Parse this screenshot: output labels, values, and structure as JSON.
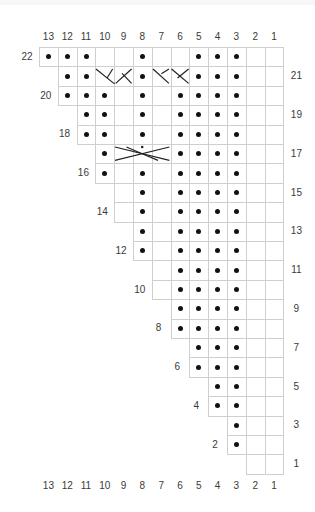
{
  "chart": {
    "title": "",
    "type": "knitting-chart",
    "columns": [
      13,
      12,
      11,
      10,
      9,
      8,
      7,
      6,
      5,
      4,
      3,
      2,
      1
    ],
    "legend": {
      "dot": "purl",
      "blank": "knit",
      "cable_2": "2-stitch cable cross",
      "cable_3": "3-stitch cable cross"
    },
    "colors": {
      "grid": "#cfcfcf",
      "symbol": "#111111",
      "text": "#3a3a3a"
    },
    "rows": [
      {
        "row": 22,
        "label_side": "left",
        "start_col": 13,
        "dots": [
          13,
          12,
          11,
          8,
          5,
          4,
          3
        ],
        "cables": []
      },
      {
        "row": 21,
        "label_side": "right",
        "start_col": 12,
        "dots": [
          12,
          11,
          8,
          5,
          4,
          3
        ],
        "cables": [
          {
            "from": 10,
            "to": 9,
            "dir": "left"
          },
          {
            "from": 7,
            "to": 6,
            "dir": "right"
          }
        ]
      },
      {
        "row": 20,
        "label_side": "left",
        "start_col": 12,
        "dots": [
          12,
          11,
          10,
          8,
          6,
          5,
          4,
          3
        ],
        "cables": []
      },
      {
        "row": 19,
        "label_side": "right",
        "start_col": 11,
        "dots": [
          11,
          10,
          8,
          6,
          5,
          4,
          3
        ],
        "cables": []
      },
      {
        "row": 18,
        "label_side": "left",
        "start_col": 11,
        "dots": [
          11,
          10,
          8,
          6,
          5,
          4,
          3
        ],
        "cables": []
      },
      {
        "row": 17,
        "label_side": "right",
        "start_col": 10,
        "dots": [
          10,
          6,
          5,
          4,
          3
        ],
        "cables": [
          {
            "from": 9,
            "to": 7,
            "dir": "cross3"
          }
        ]
      },
      {
        "row": 16,
        "label_side": "left",
        "start_col": 10,
        "dots": [
          10,
          8,
          6,
          5,
          4,
          3
        ],
        "cables": []
      },
      {
        "row": 15,
        "label_side": "right",
        "start_col": 9,
        "dots": [
          8,
          6,
          5,
          4,
          3
        ],
        "cables": []
      },
      {
        "row": 14,
        "label_side": "left",
        "start_col": 9,
        "dots": [
          8,
          6,
          5,
          4,
          3
        ],
        "cables": []
      },
      {
        "row": 13,
        "label_side": "right",
        "start_col": 8,
        "dots": [
          8,
          6,
          5,
          4,
          3
        ],
        "cables": []
      },
      {
        "row": 12,
        "label_side": "left",
        "start_col": 8,
        "dots": [
          8,
          6,
          5,
          4,
          3
        ],
        "cables": []
      },
      {
        "row": 11,
        "label_side": "right",
        "start_col": 7,
        "dots": [
          6,
          5,
          4,
          3
        ],
        "cables": []
      },
      {
        "row": 10,
        "label_side": "left",
        "start_col": 7,
        "dots": [
          6,
          5,
          4,
          3
        ],
        "cables": []
      },
      {
        "row": 9,
        "label_side": "right",
        "start_col": 6,
        "dots": [
          6,
          5,
          4,
          3
        ],
        "cables": []
      },
      {
        "row": 8,
        "label_side": "left",
        "start_col": 6,
        "dots": [
          6,
          5,
          4,
          3
        ],
        "cables": []
      },
      {
        "row": 7,
        "label_side": "right",
        "start_col": 5,
        "dots": [
          5,
          4,
          3
        ],
        "cables": []
      },
      {
        "row": 6,
        "label_side": "left",
        "start_col": 5,
        "dots": [
          5,
          4,
          3
        ],
        "cables": []
      },
      {
        "row": 5,
        "label_side": "right",
        "start_col": 4,
        "dots": [
          4,
          3
        ],
        "cables": []
      },
      {
        "row": 4,
        "label_side": "left",
        "start_col": 4,
        "dots": [
          4,
          3
        ],
        "cables": []
      },
      {
        "row": 3,
        "label_side": "right",
        "start_col": 3,
        "dots": [
          3
        ],
        "cables": []
      },
      {
        "row": 2,
        "label_side": "left",
        "start_col": 3,
        "dots": [
          3
        ],
        "cables": []
      },
      {
        "row": 1,
        "label_side": "right",
        "start_col": 2,
        "dots": [],
        "cables": []
      }
    ]
  }
}
